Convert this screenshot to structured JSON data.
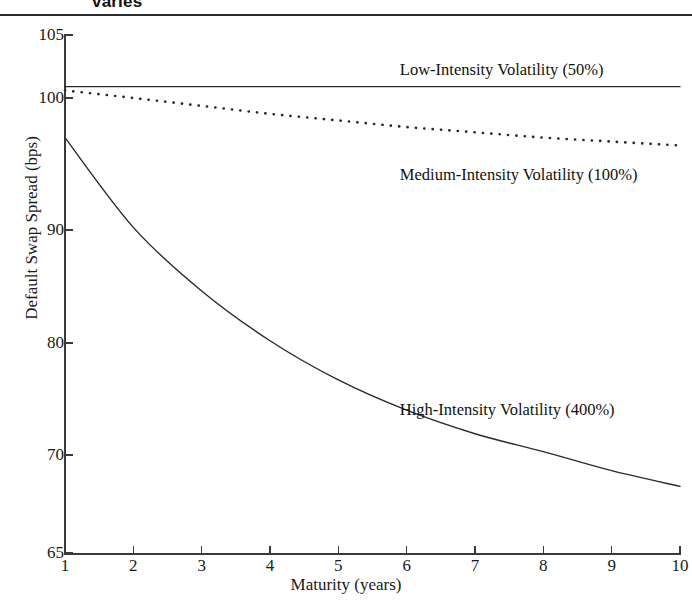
{
  "figure": {
    "title_fragment": "varies",
    "axis_color": "#3a3a3a",
    "line_color": "#2b2b2b"
  },
  "chart_data": {
    "type": "line",
    "title": "varies",
    "xlabel": "Maturity (years)",
    "ylabel": "Default Swap Spread (bps)",
    "xlim": [
      1,
      10
    ],
    "ylim": [
      65,
      105
    ],
    "xticks": [
      1,
      2,
      3,
      4,
      5,
      6,
      7,
      8,
      9,
      10
    ],
    "xtick_labels": [
      "1",
      "2",
      "3",
      "4",
      "5",
      "6",
      "7",
      "8",
      "9",
      "10"
    ],
    "yticks": [
      65,
      70,
      80,
      90,
      100,
      105
    ],
    "ytick_labels": [
      "65",
      "70",
      "80",
      "90",
      "100",
      "105"
    ],
    "grid": false,
    "legend_position": "inline-annotations",
    "x": [
      1,
      2,
      3,
      4,
      5,
      6,
      7,
      8,
      9,
      10
    ],
    "series": [
      {
        "name": "Low-Intensity Volatility (50%)",
        "style": "solid",
        "values": [
          100.9,
          100.9,
          100.9,
          100.9,
          100.9,
          100.9,
          100.9,
          100.9,
          100.9,
          100.9
        ],
        "label": "Low-Intensity Volatility (50%)",
        "label_x": 5.9,
        "label_y": 102.2
      },
      {
        "name": "Medium-Intensity Volatility (100%)",
        "style": "dotted",
        "values": [
          100.6,
          100.0,
          99.4,
          98.8,
          98.3,
          97.8,
          97.4,
          97.0,
          96.7,
          96.4
        ],
        "label": "Medium-Intensity Volatility (100%)",
        "label_x": 5.9,
        "label_y": 94.2
      },
      {
        "name": "High-Intensity Volatility (400%)",
        "style": "solid",
        "values": [
          97.0,
          90.2,
          84.6,
          80.2,
          76.7,
          74.0,
          71.9,
          70.3,
          69.2,
          68.4
        ],
        "label": "High-Intensity Volatility (400%)",
        "label_x": 5.9,
        "label_y": 74.0
      }
    ]
  }
}
